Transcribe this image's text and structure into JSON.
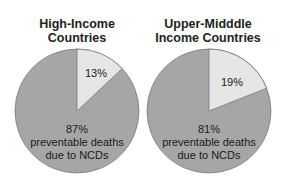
{
  "chart_data": [
    {
      "type": "pie",
      "title": "High-Income Countries",
      "title_lines": [
        "High-Income",
        "Countries"
      ],
      "slices": [
        {
          "label": "preventable deaths due to NCDs",
          "value": 87,
          "color": "#a6a6a6"
        },
        {
          "label": "other",
          "value": 13,
          "color": "#e6e6e6"
        }
      ],
      "labels": {
        "small_pct": "13%",
        "big_pct": "87%",
        "big_line1": "preventable deaths",
        "big_line2": "due to NCDs"
      }
    },
    {
      "type": "pie",
      "title": "Upper-Midddle Income Countries",
      "title_lines": [
        "Upper-Midddle",
        "Income Countries"
      ],
      "slices": [
        {
          "label": "preventable deaths due to NCDs",
          "value": 81,
          "color": "#a6a6a6"
        },
        {
          "label": "other",
          "value": 19,
          "color": "#e6e6e6"
        }
      ],
      "labels": {
        "small_pct": "19%",
        "big_pct": "81%",
        "big_line1": "preventable deaths",
        "big_line2": "due to NCDs"
      }
    }
  ]
}
